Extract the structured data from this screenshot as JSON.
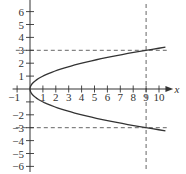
{
  "chart_data": {
    "type": "line",
    "title": "",
    "xlabel": "x",
    "ylabel": "",
    "xlim": [
      -1.3,
      11
    ],
    "ylim": [
      -6.3,
      7
    ],
    "grid": false,
    "x_ticks": [
      -1,
      1,
      2,
      3,
      4,
      5,
      6,
      7,
      8,
      9,
      10
    ],
    "x_tick_labels": [
      "−1",
      "1",
      "2",
      "3",
      "4",
      "5",
      "6",
      "7",
      "8",
      "9",
      "10"
    ],
    "y_ticks": [
      6,
      5,
      4,
      3,
      2,
      1,
      -2,
      -3,
      -4,
      -5,
      -6
    ],
    "y_tick_labels": [
      "6",
      "5",
      "4",
      "3",
      "2",
      "1",
      "−2",
      "−3",
      "−4",
      "−5",
      "−6"
    ],
    "series": [
      {
        "name": "x = y^2",
        "style": "solid",
        "color": "#333333",
        "points": [
          [
            10.5,
            3.24
          ],
          [
            9,
            3
          ],
          [
            6.25,
            2.5
          ],
          [
            4,
            2
          ],
          [
            2.25,
            1.5
          ],
          [
            1,
            1
          ],
          [
            0.25,
            0.5
          ],
          [
            0,
            0
          ],
          [
            0.25,
            -0.5
          ],
          [
            1,
            -1
          ],
          [
            2.25,
            -1.5
          ],
          [
            4,
            -2
          ],
          [
            6.25,
            -2.5
          ],
          [
            9,
            -3
          ],
          [
            10.5,
            -3.24
          ]
        ]
      }
    ],
    "reference_lines": [
      {
        "orientation": "horizontal",
        "value": 3,
        "style": "dashed"
      },
      {
        "orientation": "horizontal",
        "value": -3,
        "style": "dashed"
      },
      {
        "orientation": "vertical",
        "value": 9,
        "style": "dashed"
      }
    ]
  },
  "colors": {
    "axis": "#333333",
    "curve": "#333333",
    "dashed": "#555555"
  }
}
